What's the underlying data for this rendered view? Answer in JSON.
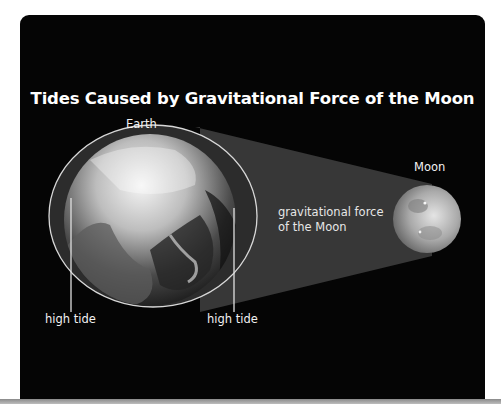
{
  "diagram": {
    "title": "Tides Caused by Gravitational Force of the Moon",
    "labels": {
      "earth": "Earth",
      "moon": "Moon",
      "force_line1": "gravitational force",
      "force_line2": "of the Moon",
      "high_tide_left": "high tide",
      "high_tide_right": "high tide"
    },
    "colors": {
      "background": "#050505",
      "beam": "#3a3a3a",
      "tidal_bulge": "#2e2e2e",
      "outline": "#d8d8d8",
      "text": "#f2f2f2"
    }
  }
}
